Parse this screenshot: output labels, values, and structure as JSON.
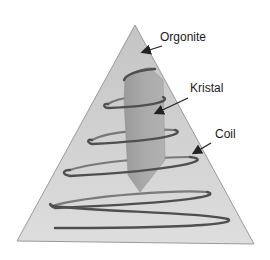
{
  "diagram": {
    "labels": {
      "orgonite": "Orgonite",
      "kristal": "Kristal",
      "coil": "Coil"
    },
    "colors": {
      "pyramid_fill": "#d4d4d4",
      "pyramid_edge": "#9a9a9a",
      "crystal_fill": "#a6a6a6",
      "coil_stroke": "#5a5a5a",
      "arrow": "#222222",
      "text": "#1a1a1a"
    }
  }
}
